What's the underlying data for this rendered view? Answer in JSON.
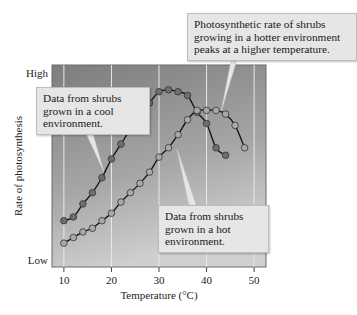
{
  "chart_data": {
    "type": "line",
    "title": "",
    "xlabel": "Temperature (°C)",
    "ylabel": "Rate of photosynthesis",
    "xlim": [
      7.5,
      52.5
    ],
    "ylim": [
      0,
      100
    ],
    "x_ticks": [
      10,
      20,
      30,
      40,
      50
    ],
    "y_tick_labels": [
      {
        "value": 100,
        "label": "High"
      },
      {
        "value": 0,
        "label": "Low"
      }
    ],
    "grid": "vertical",
    "series": [
      {
        "name": "Data from shrubs grown in a cool environment",
        "color": "#6e6e6e",
        "x": [
          10,
          12,
          14,
          16,
          18,
          20,
          22,
          24,
          26,
          28,
          30,
          32,
          34,
          36,
          38,
          40,
          42,
          44
        ],
        "y": [
          21,
          23,
          30,
          36,
          44,
          54,
          62,
          70,
          77,
          84,
          90,
          91,
          90,
          88,
          79,
          73,
          60,
          56
        ]
      },
      {
        "name": "Data from shrubs grown in a hot environment",
        "color": "#a9a9a9",
        "x": [
          10,
          12,
          14,
          16,
          18,
          20,
          22,
          24,
          26,
          28,
          30,
          32,
          34,
          36,
          38,
          40,
          42,
          44,
          46,
          48
        ],
        "y": [
          9,
          12,
          15,
          17,
          21,
          25,
          31,
          36,
          41,
          47,
          55,
          60,
          67,
          75,
          80,
          80,
          80,
          78,
          72,
          60
        ]
      }
    ],
    "annotations": [
      {
        "text": "Data from shrubs\ngrown in a cool\nenvironment.",
        "points_to": "cool"
      },
      {
        "text": "Data from shrubs\ngrown in a hot\nenvironment.",
        "points_to": "hot"
      },
      {
        "text": "Photosynthetic rate of shrubs\ngrowing in a hotter environment\npeaks at a higher temperature.",
        "points_to": "hot-peak"
      }
    ]
  }
}
